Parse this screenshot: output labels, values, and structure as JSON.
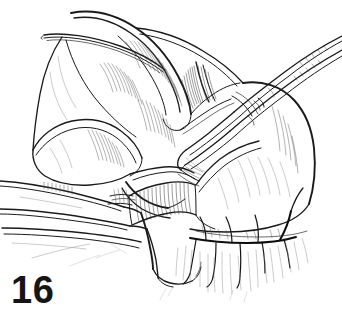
{
  "figure": {
    "number": "16",
    "alt": "surgical-line-art-illustration",
    "background_color": "#ffffff",
    "ink_color": "#1a1a1a"
  },
  "canvas": {
    "width": 342,
    "height": 322
  },
  "scene": {
    "title": "",
    "elements": [
      {
        "name": "upper-left-retractor-blade",
        "description": "curved retractor blade arcing from top-left toward center"
      },
      {
        "name": "curved-tissue-lobe-upper",
        "description": "large curved anatomical lobe with fine hatching at top center"
      },
      {
        "name": "hatched-tissue-flap-center",
        "description": "shaded tissue flap with dense parallel hatching"
      },
      {
        "name": "forceps-upper-right",
        "description": "long slender surgical forceps entering from the upper right corner"
      },
      {
        "name": "clamp-lower-left",
        "description": "clamp or dissector shafts entering from the lower left"
      },
      {
        "name": "tissue-mass-right",
        "description": "rounded tissue mass occupying the right side"
      },
      {
        "name": "vessel-branches-lower-right",
        "description": "dark branching vessels along the lower border of the tissue mass"
      },
      {
        "name": "fascial-strands-bottom",
        "description": "fine fibrous strands descending from the lower tissue margin"
      }
    ]
  }
}
